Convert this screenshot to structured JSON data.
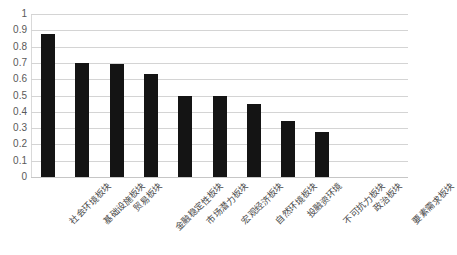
{
  "chart_data": {
    "type": "bar",
    "title": "",
    "subtitle": "",
    "xlabel": "",
    "ylabel": "",
    "ylim": [
      0,
      1
    ],
    "ytick_labels": [
      "1",
      "0.9",
      "0.8",
      "0.7",
      "0.6",
      "0.5",
      "0.4",
      "0.3",
      "0.2",
      "0.1",
      "0"
    ],
    "ytick_values": [
      1,
      0.9,
      0.8,
      0.7,
      0.6,
      0.5,
      0.4,
      0.3,
      0.2,
      0.1,
      0
    ],
    "grid": true,
    "legend": "none",
    "bar_color": "#141414",
    "gridline_color": "#d4d4d4",
    "background_color": "#ffffff",
    "categories": [
      "社会环境板块",
      "基础设施板块",
      "贸易板块",
      "金融稳定性板块",
      "市场潜力板块",
      "宏观经济板块",
      "自然环境板块",
      "投融资环境",
      "不可抗力板块",
      "政治板块",
      "要素需求板块"
    ],
    "values": [
      0.88,
      0.7,
      0.695,
      0.63,
      0.5,
      0.498,
      0.447,
      0.345,
      0.275,
      0,
      0
    ]
  }
}
